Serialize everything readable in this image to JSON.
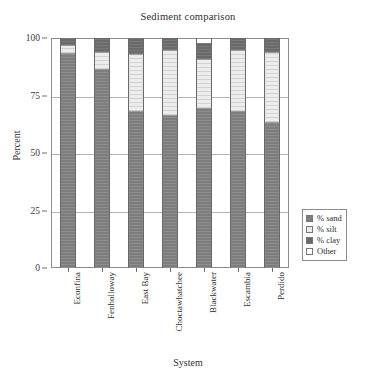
{
  "chart_data": {
    "type": "bar",
    "subtype": "stacked-column",
    "title": "Sediment comparison",
    "xlabel": "System",
    "ylabel": "Percent",
    "ylim": [
      0,
      100
    ],
    "yticks": [
      0,
      25,
      50,
      75,
      100
    ],
    "ytick_labels": [
      "0",
      "25",
      "50",
      "75",
      "100"
    ],
    "grid": true,
    "legend_position": "inside-lower-right",
    "categories": [
      "Econfina",
      "Fenholloway",
      "East Bay",
      "Choctawhatchee",
      "Blackwater",
      "Escambia",
      "Perdido"
    ],
    "series": [
      {
        "name": "% sand",
        "color": "#7d7d7d",
        "values": [
          93,
          86,
          68,
          66,
          69,
          68,
          63
        ]
      },
      {
        "name": "% silt",
        "color": "#ececec",
        "values": [
          4,
          8,
          25,
          29,
          22,
          27,
          31
        ]
      },
      {
        "name": "% clay",
        "color": "#6a6a6a",
        "values": [
          3,
          6,
          7,
          5,
          7,
          5,
          6
        ]
      },
      {
        "name": "Other",
        "color": "#ffffff",
        "values": [
          0,
          0,
          0,
          0,
          2,
          0,
          0
        ]
      }
    ]
  },
  "legend": {
    "entries": [
      {
        "label": "% sand",
        "swatch": "sand"
      },
      {
        "label": "% silt",
        "swatch": "silt"
      },
      {
        "label": "% clay",
        "swatch": "clay"
      },
      {
        "label": "Other",
        "swatch": "other"
      }
    ]
  }
}
